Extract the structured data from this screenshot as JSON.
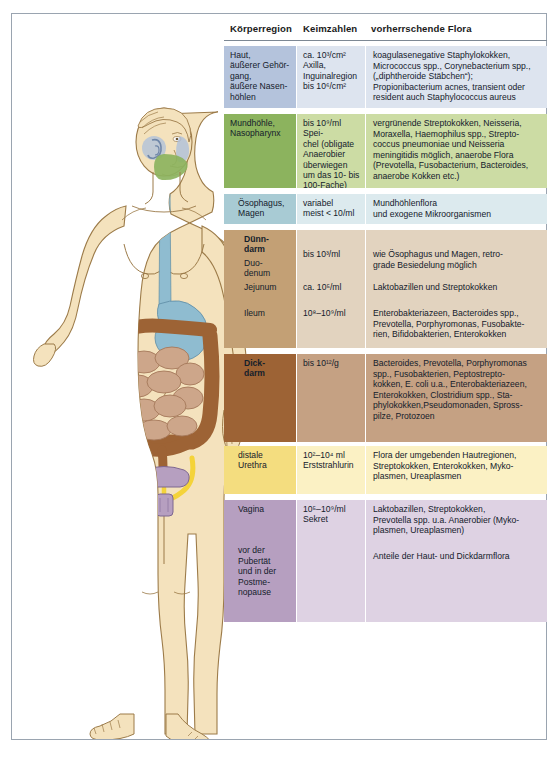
{
  "table": {
    "headers": {
      "region": "Körperregion",
      "counts": "Keimzahlen",
      "flora": "vorherrschende Flora"
    },
    "rows": [
      {
        "id": "haut",
        "region": "Haut,\näußerer Gehör-\ngang,\näußere Nasen-\nhöhlen",
        "counts": "ca. 10³/cm²\nAxilla,\nInguinalregion\nbis 10⁶/cm²",
        "flora": "koagulasenegative Staphylokokken,\nMicrococcus spp., Corynebacterium spp.,\n(„diphtheroide Stäbchen“);\nPropionibacterium acnes, transient oder\nresident auch Staphylococcus aureus",
        "region_color": "#b4c3dc",
        "data_color": "#dde4ef"
      },
      {
        "id": "mundhoehle",
        "region": "Mundhöhle,\nNasopharynx",
        "counts": "bis 10⁹/ml Spei-\nchel (obligate\nAnaerobier\nüberwiegen\num das 10- bis\n100-Fache)",
        "flora": "vergrünende Streptokokken, Neisseria,\nMoraxella, Haemophilus spp., Strepto-\ncoccus pneumoniae und Neisseria\nmeningitidis möglich, anaerobe Flora\n(Prevotella, Fusobacterium, Bacteroides,\nanaerobe Kokken etc.)",
        "region_color": "#8cb35e",
        "data_color": "#ccdca4"
      },
      {
        "id": "oesophagus",
        "region": "Ösophagus,\nMagen",
        "counts": "variabel\nmeist < 10/ml",
        "flora": "Mundhöhlenflora\nund exogene Mikroorganismen",
        "region_color": "#a8cbd4",
        "data_color": "#dceaee"
      },
      {
        "id": "duenndarm",
        "region": "Dünn-\ndarm",
        "region_sub": "Duo-\ndenum",
        "counts": "bis 10³/ml",
        "flora": "wie Ösophagus und Magen, retro-\ngrade Besiedelung möglich",
        "region_color": "#c3a075",
        "data_color": "#e2d3bf"
      },
      {
        "id": "jejunum",
        "region": "Jejunum",
        "counts": "ca. 10⁵/ml",
        "flora": "Laktobazillen und Streptokokken",
        "region_color": "#c3a075",
        "data_color": "#e2d3bf"
      },
      {
        "id": "ileum",
        "region": "Ileum",
        "counts": "10⁸–10⁹/ml",
        "flora": "Enterobakteriazeen, Bacteroides spp.,\nPrevotella, Porphyromonas, Fusobakte-\nrien, Bifidobakterien, Enterokokken",
        "region_color": "#c3a075",
        "data_color": "#e2d3bf"
      },
      {
        "id": "dickdarm",
        "region": "Dick-\ndarm",
        "counts": "bis 10¹²/g",
        "flora": "Bacteroides, Prevotella, Porphyromonas\nspp., Fusobakterien, Peptostrepto-\nkokken, E. coli u.a., Enterobakteriazeen,\nEnterokokken, Clostridium spp., Sta-\nphylokokken,Pseudomonaden, Spross-\npilze, Protozoen",
        "region_color": "#9d6335",
        "data_color": "#c5a183"
      },
      {
        "id": "urethra",
        "region": "distale\nUrethra",
        "counts": "10²–10⁴ ml\nErststrahlurin",
        "flora": "Flora der umgebenden Hautregionen,\nStreptokokken, Enterokokken, Myko-\nplasmen, Ureaplasmen",
        "region_color": "#f4dd7f",
        "data_color": "#fbf1c4"
      },
      {
        "id": "vagina",
        "region": "Vagina",
        "region_sub": "vor der\n Pubertät\nund in der\n Postme-\nnopause",
        "counts": "10⁵–10⁹/ml\nSekret",
        "flora": "Laktobazillen, Streptokokken,\nPrevotella spp. u.a. Anaerobier (Myko-\nplasmen, Ureaplasmen)",
        "flora_sub": "Anteile der Haut- und Dickdarmflora",
        "region_color": "#b69fc0",
        "data_color": "#ded2e3"
      }
    ]
  },
  "illustration": {
    "alt": "Frontalansicht einer weiblichen Figur mit eingezeichneten Organen",
    "organs": [
      {
        "name": "ear-canal",
        "label": "äußerer Gehörgang",
        "color": "#a9bedd"
      },
      {
        "name": "nasal-cavity",
        "label": "äußere Nasenhöhlen",
        "color": "#a9bedd"
      },
      {
        "name": "oral-cavity",
        "label": "Mundhöhle/Nasopharynx",
        "color": "#8cb35e"
      },
      {
        "name": "esophagus",
        "label": "Ösophagus",
        "color": "#92bfd1"
      },
      {
        "name": "stomach",
        "label": "Magen",
        "color": "#92bfd1"
      },
      {
        "name": "small-intestine",
        "label": "Dünndarm",
        "color": "#c9a285"
      },
      {
        "name": "large-intestine",
        "label": "Dickdarm",
        "color": "#9d6335"
      },
      {
        "name": "urethra-tubes",
        "label": "Urethra",
        "color": "#f4d33a"
      },
      {
        "name": "vagina-uterus",
        "label": "Vagina/Uterus",
        "color": "#b69fc0"
      }
    ],
    "skin_color": "#f2dfb8",
    "outline_color": "#8a6a3c"
  }
}
